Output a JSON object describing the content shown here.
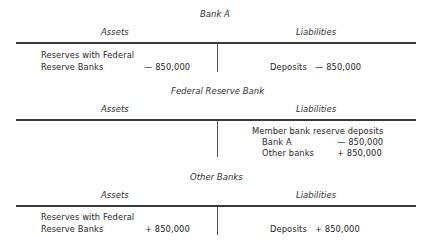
{
  "sections": [
    {
      "title": "Bank A",
      "assets_header": "Assets",
      "liabilities_header": "Liabilities",
      "assets": [
        {
          "label_line1": "Reserves with Federal",
          "label_line2": "Reserve Banks",
          "value": "— 850,000"
        }
      ],
      "liabilities": [
        {
          "label": "Deposits",
          "value": "— 850,000"
        }
      ]
    },
    {
      "title": "Federal Reserve Bank",
      "assets_header": "Assets",
      "liabilities_header": "Liabilities",
      "assets": [],
      "liabilities": [
        {
          "label": "Member bank reserve deposits"
        },
        {
          "label": "Bank A",
          "value": "— 850,000"
        },
        {
          "label": "Other banks",
          "value": "+ 850,000"
        }
      ]
    },
    {
      "title": "Other Banks",
      "assets_header": "Assets",
      "liabilities_header": "Liabilities",
      "assets": [
        {
          "label_line1": "Reserves with Federal",
          "label_line2": "Reserve Banks",
          "value": "+ 850,000"
        }
      ],
      "liabilities": [
        {
          "label": "Deposits",
          "value": "+ 850,000"
        }
      ]
    }
  ]
}
